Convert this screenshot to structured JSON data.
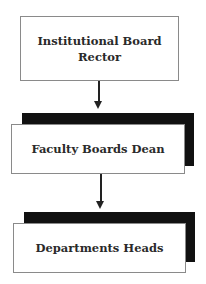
{
  "diagram": {
    "type": "hierarchy-flowchart",
    "nodes": [
      {
        "id": "institutional-board",
        "lines": [
          "Institutional Board",
          "Rector"
        ]
      },
      {
        "id": "faculty-boards",
        "lines": [
          "Faculty Boards Dean"
        ]
      },
      {
        "id": "departments",
        "lines": [
          "Departments Heads"
        ]
      }
    ],
    "edges": [
      {
        "from": "institutional-board",
        "to": "faculty-boards"
      },
      {
        "from": "faculty-boards",
        "to": "departments"
      }
    ],
    "colors": {
      "shadow": "#111111",
      "border": "#8a8a8a",
      "text": "#2a2a2a",
      "arrow": "#222222"
    }
  }
}
